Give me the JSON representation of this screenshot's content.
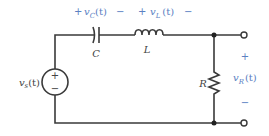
{
  "diagram": {
    "type": "series RLC circuit",
    "colors": {
      "wire": "#3a3a3a",
      "label_accent": "#5b80c2",
      "component_label": "#444444"
    },
    "source": {
      "label": "v",
      "subscript": "s",
      "suffix": "(t)",
      "plus": "+",
      "minus": "−"
    },
    "capacitor": {
      "label": "C",
      "voltage": {
        "plus": "+",
        "name": "v",
        "subscript": "C",
        "suffix": "(t)",
        "minus": "−"
      }
    },
    "inductor": {
      "label": "L",
      "voltage": {
        "plus": "+",
        "name": "v",
        "subscript": "L",
        "suffix": "(t)",
        "minus": "−"
      }
    },
    "resistor": {
      "label": "R"
    },
    "output": {
      "plus": "+",
      "name": "v",
      "subscript": "R",
      "suffix": "(t)",
      "minus": "−"
    }
  }
}
